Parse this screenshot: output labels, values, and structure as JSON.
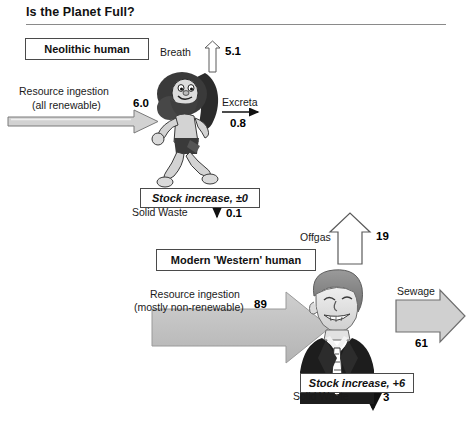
{
  "header": {
    "title": "Is the Planet Full?"
  },
  "diagram": {
    "type": "flow-diagram",
    "caption_boxes": [
      {
        "id": "neolithic-human",
        "label": "Neolithic human"
      },
      {
        "id": "modern-western-human",
        "label": "Modern 'Western' human"
      },
      {
        "id": "stock-increase-neolithic",
        "label": "Stock increase, ±0"
      },
      {
        "id": "stock-increase-modern",
        "label": "Stock increase, +6"
      }
    ],
    "neolithic": {
      "box_label": "Neolithic human",
      "inputs": [
        {
          "name": "resource-ingestion",
          "label_line1": "Resource ingestion",
          "label_line2": "(all renewable)",
          "value": "6.0",
          "direction": "right",
          "style": "thin-outline-arrow"
        }
      ],
      "outputs": [
        {
          "name": "breath",
          "label": "Breath",
          "value": "5.1",
          "direction": "up",
          "style": "thin-outline-arrow"
        },
        {
          "name": "excreta",
          "label": "Excreta",
          "value": "0.8",
          "direction": "right",
          "style": "line-arrow"
        },
        {
          "name": "solid-waste",
          "label": "Solid Waste",
          "value": "0.1",
          "direction": "down",
          "style": "line-arrow"
        }
      ],
      "stock_box": "Stock increase, ±0",
      "figure_alt": "caveman"
    },
    "modern": {
      "box_label": "Modern 'Western' human",
      "inputs": [
        {
          "name": "resource-ingestion",
          "label_line1": "Resource ingestion",
          "label_line2": "(mostly non-renewable)",
          "value": "89",
          "direction": "right",
          "style": "thick-block-arrow"
        }
      ],
      "outputs": [
        {
          "name": "offgas",
          "label": "Offgas",
          "value": "19",
          "direction": "up",
          "style": "wide-outline-arrow"
        },
        {
          "name": "sewage",
          "label": "Sewage",
          "value": "61",
          "direction": "right",
          "style": "wide-outline-arrow"
        },
        {
          "name": "solid-waste",
          "label": "Solid Waste",
          "value": "3",
          "direction": "down",
          "style": "line-arrow"
        }
      ],
      "stock_box": "Stock increase, +6",
      "figure_alt": "businessman"
    }
  },
  "colors": {
    "arrow_fill": "#c9c9c9",
    "arrow_stroke": "#6e6e6e",
    "outline_fill": "#ffffff",
    "outline_stroke": "#555555",
    "rule": "#8a8a8a",
    "text": "#1a1a1a"
  }
}
